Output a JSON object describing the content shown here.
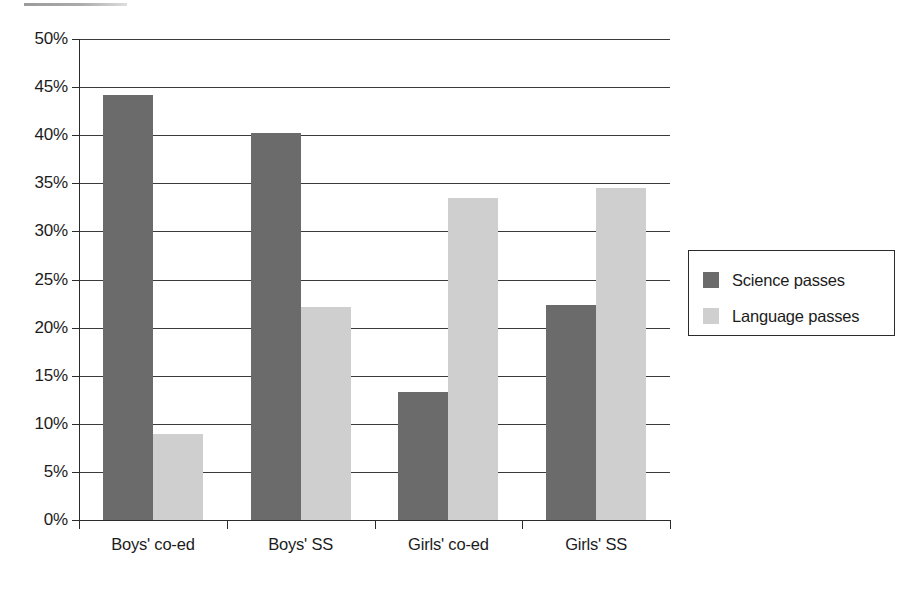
{
  "chart_data": {
    "type": "bar",
    "title": "",
    "subtitle": "",
    "xlabel": "",
    "ylabel": "",
    "categories": [
      "Boys' co-ed",
      "Boys' SS",
      "Girls' co-ed",
      "Girls' SS"
    ],
    "series": [
      {
        "name": "Science passes",
        "color": "#6b6b6b",
        "values": [
          44.2,
          40.2,
          13.3,
          22.4
        ]
      },
      {
        "name": "Language passes",
        "color": "#cfcfcf",
        "values": [
          8.9,
          22.1,
          33.5,
          34.5
        ]
      }
    ],
    "ylim": [
      0,
      50
    ],
    "ytick_values": [
      0,
      5,
      10,
      15,
      20,
      25,
      30,
      35,
      40,
      45,
      50
    ],
    "ytick_labels": [
      "0%",
      "5%",
      "10%",
      "15%",
      "20%",
      "25%",
      "30%",
      "35%",
      "40%",
      "45%",
      "50%"
    ],
    "grid": true,
    "grid_axis": "y",
    "legend_position": "right",
    "background_color": "#ffffff",
    "axis_color": "#2b2b2b"
  },
  "legend": {
    "items": [
      {
        "label": "Science passes",
        "color": "#6b6b6b",
        "swatch_name": "legend-swatch-science"
      },
      {
        "label": "Language passes",
        "color": "#cfcfcf",
        "swatch_name": "legend-swatch-language"
      }
    ]
  }
}
